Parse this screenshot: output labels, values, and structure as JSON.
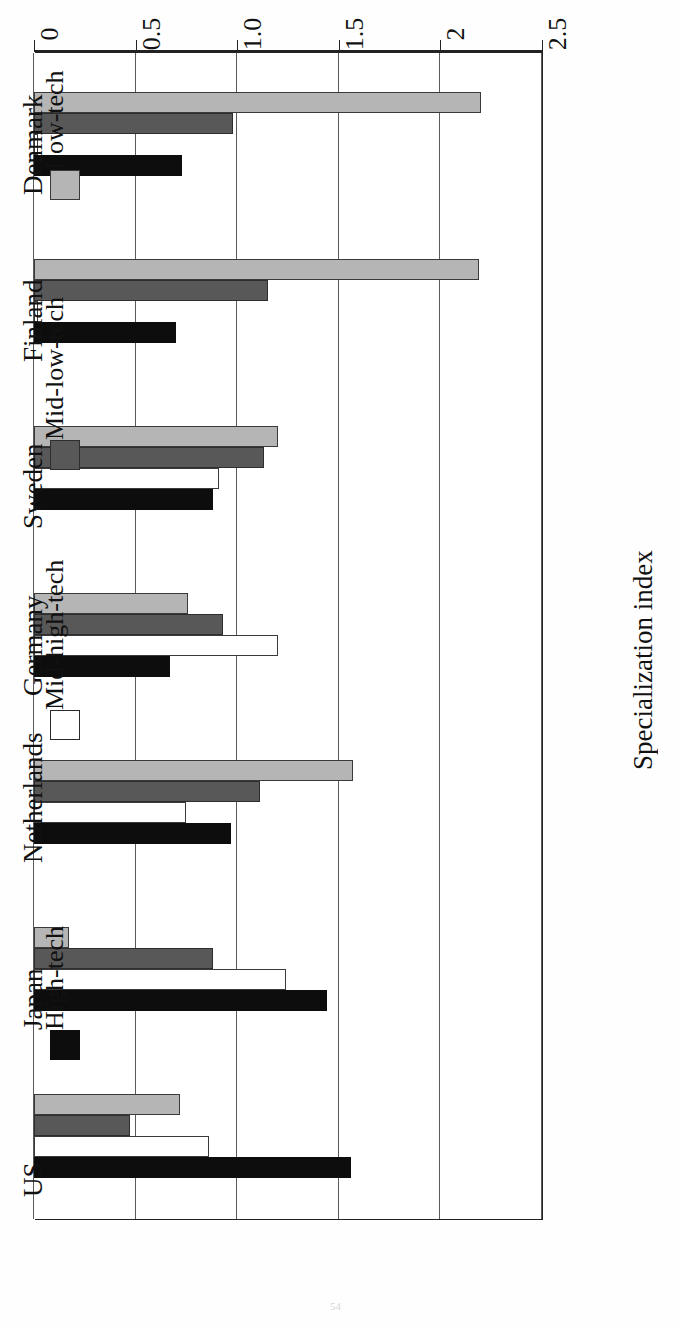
{
  "axis": {
    "ylabel": "Specialization index",
    "tick_labels": [
      "0",
      "0.5",
      "1.0",
      "1.5",
      "2",
      "2.5"
    ]
  },
  "legend": {
    "items": [
      {
        "label": "High-tech",
        "color": "#0d0d0d",
        "swatch": "sw-high"
      },
      {
        "label": "Mid-high-tech",
        "color": "#ffffff",
        "swatch": "sw-midhigh"
      },
      {
        "label": "Mid-low-tech",
        "color": "#585858",
        "swatch": "sw-midlow"
      },
      {
        "label": "Low-tech",
        "color": "#b5b5b5",
        "swatch": "sw-low"
      }
    ]
  },
  "chart_data": {
    "type": "bar",
    "orientation": "horizontal",
    "title": "",
    "xlabel": "",
    "ylabel": "Specialization index",
    "ylim": [
      0,
      2.5
    ],
    "yticks": [
      0,
      0.5,
      1.0,
      1.5,
      2,
      2.5
    ],
    "grid": true,
    "legend_position": "right",
    "categories": [
      "US",
      "Japan",
      "Netherlands",
      "Germany",
      "Sweden",
      "Finland",
      "Denmark"
    ],
    "series": [
      {
        "name": "High-tech",
        "color": "#0d0d0d",
        "values": [
          1.56,
          1.44,
          0.97,
          0.67,
          0.88,
          0.7,
          0.73
        ]
      },
      {
        "name": "Mid-high-tech",
        "color": "#ffffff",
        "values": [
          0.86,
          1.24,
          0.75,
          1.2,
          0.91,
          0.02,
          0.02
        ]
      },
      {
        "name": "Mid-low-tech",
        "color": "#585858",
        "values": [
          0.47,
          0.88,
          1.11,
          0.93,
          1.13,
          1.15,
          0.98
        ]
      },
      {
        "name": "Low-tech",
        "color": "#b5b5b5",
        "values": [
          0.72,
          0.17,
          1.57,
          0.76,
          1.2,
          2.19,
          2.2
        ]
      }
    ]
  },
  "page": {
    "folio": "54"
  }
}
